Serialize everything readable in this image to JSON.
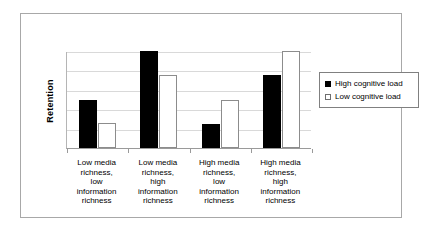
{
  "chart_data": {
    "type": "bar",
    "title": "",
    "xlabel": "",
    "ylabel": "Retention",
    "ylim": [
      0,
      100
    ],
    "grid": true,
    "legend_position": "right",
    "gridline_count": 4,
    "categories": [
      "Low media richness, low information richness",
      "Low media richness, high information richness",
      "High media richness, low information richness",
      "High media richness, high information richness"
    ],
    "category_lines": [
      [
        "Low media",
        "richness,",
        "low",
        "information",
        "richness"
      ],
      [
        "Low media",
        "richness,",
        "high",
        "information",
        "richness"
      ],
      [
        "High media",
        "richness,",
        "low",
        "information",
        "richness"
      ],
      [
        "High media",
        "richness,",
        "high",
        "information",
        "richness"
      ]
    ],
    "series": [
      {
        "name": "High cognitive load",
        "color": "#000000",
        "values": [
          50,
          100,
          25,
          75
        ]
      },
      {
        "name": "Low cognitive load",
        "color": "#ffffff",
        "values": [
          26,
          75,
          50,
          100
        ]
      }
    ]
  },
  "legend": {
    "items": [
      {
        "label": "High cognitive load",
        "swatch": "filled-black-square-icon"
      },
      {
        "label": "Low cognitive load",
        "swatch": "empty-white-square-icon"
      }
    ]
  },
  "colors": {
    "frame_border": "#a8a8a8",
    "axis_line": "#9a9a9a",
    "gridline": "#d9d9d9",
    "series_high": "#000000",
    "series_low": "#ffffff",
    "series_low_border": "#8c8c8c",
    "legend_border": "#808080",
    "text": "#000000",
    "background": "#ffffff"
  }
}
